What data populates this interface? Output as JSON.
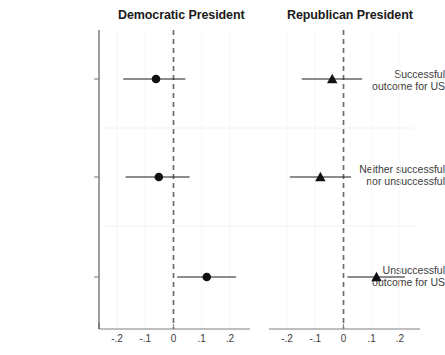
{
  "chart_data": {
    "type": "scatter",
    "title": "",
    "subtitle": "",
    "xlabel": "",
    "ylabel": "",
    "xlim": [
      -0.25,
      0.25
    ],
    "xticks": [
      -0.2,
      -0.1,
      0,
      0.1,
      0.2
    ],
    "xticklabels": [
      "-.2",
      "-.1",
      "0",
      ".1",
      ".2"
    ],
    "grid": true,
    "legend": "none",
    "reference_line": 0,
    "categories": [
      "Successful outcome for US",
      "Neither successful nor unsuccessful",
      "Unsuccessful outcome for US"
    ],
    "panels": [
      {
        "label": "Democratic President",
        "marker": "circle",
        "points": [
          {
            "category": "Successful outcome for US",
            "estimate": -0.062,
            "ci_low": -0.178,
            "ci_high": 0.042
          },
          {
            "category": "Neither successful nor unsuccessful",
            "estimate": -0.052,
            "ci_low": -0.17,
            "ci_high": 0.057
          },
          {
            "category": "Unsuccessful outcome for US",
            "estimate": 0.118,
            "ci_low": 0.013,
            "ci_high": 0.222
          }
        ]
      },
      {
        "label": "Republican President",
        "marker": "triangle",
        "points": [
          {
            "category": "Successful outcome for US",
            "estimate": -0.04,
            "ci_low": -0.148,
            "ci_high": 0.066
          },
          {
            "category": "Neither successful nor unsuccessful",
            "estimate": -0.082,
            "ci_low": -0.19,
            "ci_high": 0.027
          },
          {
            "category": "Unsuccessful outcome for US",
            "estimate": 0.117,
            "ci_low": 0.014,
            "ci_high": 0.218
          }
        ]
      }
    ]
  },
  "panels": {
    "democratic": {
      "title": "Democratic President"
    },
    "republican": {
      "title": "Republican President"
    }
  },
  "row_labels": [
    {
      "line1": "Successful",
      "line2": "outcome for US"
    },
    {
      "line1": "Neither successful",
      "line2": "nor unsuccessful"
    },
    {
      "line1": "Unsuccessful",
      "line2": "outcome for US"
    }
  ],
  "axis": {
    "left_ticks": [
      "-.2",
      "-.1",
      "0",
      ".1",
      ".2"
    ],
    "right_ticks": [
      "-.2",
      "-.1",
      "0",
      ".1",
      ".2"
    ]
  },
  "colors": {
    "marker": "#111111",
    "axis": "#808080",
    "zero_line": "#6e6e6e",
    "grid": "#f2f2f2",
    "text": "#3b3b3b"
  }
}
